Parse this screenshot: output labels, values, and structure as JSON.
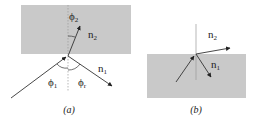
{
  "colors": {
    "medium": "#c9c9c9",
    "ray": "#333333",
    "normal": "#9a9a9a",
    "background": "#ffffff"
  },
  "panels": [
    {
      "id": "a",
      "caption": "(a)",
      "upper_medium": {
        "label": "n",
        "sub": "2",
        "shaded": true
      },
      "lower_medium": {
        "label": "n",
        "sub": "1",
        "shaded": false
      },
      "angles": [
        {
          "label": "ϕ",
          "sub": "2",
          "meaning": "refraction angle"
        },
        {
          "label": "ϕ",
          "sub": "1",
          "meaning": "incidence angle"
        },
        {
          "label": "ϕ",
          "sub": "r",
          "meaning": "reflection angle"
        }
      ],
      "rays": [
        "incident",
        "refracted",
        "reflected"
      ]
    },
    {
      "id": "b",
      "caption": "(b)",
      "upper_medium": {
        "label": "n",
        "sub": "2",
        "shaded": false
      },
      "lower_medium": {
        "label": "n",
        "sub": "1",
        "shaded": true
      },
      "rays": [
        "incident",
        "refracted",
        "reflected"
      ]
    }
  ]
}
